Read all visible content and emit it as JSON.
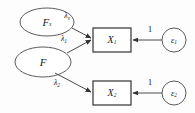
{
  "diagram": {
    "type": "sem-path-diagram",
    "canvas": {
      "width": 195,
      "height": 113
    },
    "colors": {
      "background": "#fdfdfd",
      "ellipse_stroke": "#5b5b5b",
      "box_stroke": "#333333",
      "arrow_stroke": "#4a4a4a",
      "text": "#1c1c1c"
    },
    "latent_variables": [
      {
        "id": "Fs",
        "shape": "ellipse",
        "symbol": "F",
        "subscript": "s",
        "cx": 47,
        "cy": 22,
        "rx": 27,
        "ry": 14
      },
      {
        "id": "F",
        "shape": "ellipse",
        "symbol": "F",
        "subscript": "",
        "cx": 43,
        "cy": 62,
        "rx": 28,
        "ry": 15
      }
    ],
    "observed_variables": [
      {
        "id": "X1",
        "shape": "rectangle",
        "symbol": "X",
        "subscript": "1",
        "x": 93,
        "y": 28,
        "width": 38,
        "height": 24
      },
      {
        "id": "X2",
        "shape": "rectangle",
        "symbol": "X",
        "subscript": "2",
        "x": 93,
        "y": 81,
        "width": 38,
        "height": 24
      }
    ],
    "error_terms": [
      {
        "id": "e1",
        "shape": "circle",
        "symbol": "ε",
        "subscript": "1",
        "cx": 174,
        "cy": 40,
        "r": 12
      },
      {
        "id": "e2",
        "shape": "circle",
        "symbol": "ε",
        "subscript": "2",
        "cx": 174,
        "cy": 93,
        "r": 12
      }
    ],
    "paths": [
      {
        "id": "path-Fs-X1",
        "from": "Fs",
        "to": "X1",
        "label": "λ",
        "subscript": "s",
        "label_x": 67,
        "label_y": 18
      },
      {
        "id": "path-F-X1",
        "from": "F",
        "to": "X1",
        "label": "λ",
        "subscript": "1",
        "label_x": 64,
        "label_y": 40
      },
      {
        "id": "path-F-X2",
        "from": "F",
        "to": "X2",
        "label": "λ",
        "subscript": "2",
        "label_x": 57,
        "label_y": 83
      },
      {
        "id": "path-e1-X1",
        "from": "e1",
        "to": "X1",
        "label": "1",
        "subscript": "",
        "label_x": 150,
        "label_y": 31
      },
      {
        "id": "path-e2-X2",
        "from": "e2",
        "to": "X2",
        "label": "1",
        "subscript": "",
        "label_x": 150,
        "label_y": 84
      }
    ]
  }
}
